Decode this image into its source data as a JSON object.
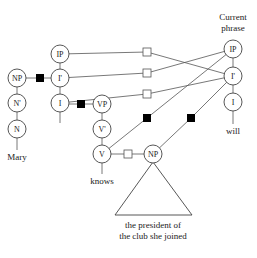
{
  "diagram": {
    "header": {
      "line1": "Current",
      "line2": "phrase"
    },
    "colors": {
      "line": "#555555",
      "node_border": "#444444",
      "filled_square": "#000000",
      "open_square": "#ffffff",
      "text": "#1a1a1a"
    },
    "left_tree": {
      "nodes": [
        {
          "id": "np_subject",
          "label": "NP",
          "x": 17,
          "y": 78
        },
        {
          "id": "n_bar",
          "label": "N'",
          "x": 17,
          "y": 103
        },
        {
          "id": "n",
          "label": "N",
          "x": 17,
          "y": 129
        },
        {
          "id": "ip",
          "label": "IP",
          "x": 60,
          "y": 54
        },
        {
          "id": "i_bar",
          "label": "I'",
          "x": 60,
          "y": 78
        },
        {
          "id": "i",
          "label": "I",
          "x": 60,
          "y": 103
        },
        {
          "id": "vp",
          "label": "VP",
          "x": 102,
          "y": 104
        },
        {
          "id": "v_bar",
          "label": "V'",
          "x": 102,
          "y": 129
        },
        {
          "id": "v",
          "label": "V",
          "x": 102,
          "y": 154
        },
        {
          "id": "np_object",
          "label": "NP",
          "x": 153,
          "y": 154
        }
      ],
      "words": [
        {
          "id": "mary",
          "text": "Mary",
          "x": 17,
          "y": 159
        },
        {
          "id": "knows",
          "text": "knows",
          "x": 102,
          "y": 183
        }
      ],
      "np_object_text": {
        "line1": "the president of",
        "line2": "the club she joined"
      }
    },
    "current_phrase": {
      "nodes": [
        {
          "id": "cp_ip",
          "label": "IP",
          "x": 233,
          "y": 49
        },
        {
          "id": "cp_i_bar",
          "label": "I'",
          "x": 233,
          "y": 76
        },
        {
          "id": "cp_i",
          "label": "I",
          "x": 233,
          "y": 102
        }
      ],
      "word": {
        "text": "will",
        "x": 233,
        "y": 133
      }
    },
    "links": [
      {
        "from": "ip",
        "to": "cp_i_bar",
        "marker": "open",
        "mx": 147,
        "my": 52
      },
      {
        "from": "i_bar",
        "to": "cp_ip",
        "marker": "open",
        "mx": 147,
        "my": 73
      },
      {
        "from": "i",
        "to": "cp_i_bar",
        "marker": "open",
        "mx": 147,
        "my": 94
      },
      {
        "from": "v",
        "to": "cp_ip",
        "marker": "filled",
        "mx": 147,
        "my": 118
      },
      {
        "from": "np_object",
        "to": "cp_i_bar",
        "marker": "filled",
        "mx": 191,
        "my": 118
      }
    ],
    "local_markers": [
      {
        "between": "np_subject-i_bar",
        "marker": "filled",
        "mx": 40,
        "my": 78
      },
      {
        "between": "i-vp",
        "marker": "filled",
        "mx": 81,
        "my": 104
      },
      {
        "between": "v-np_object",
        "marker": "open",
        "mx": 128,
        "my": 154
      }
    ]
  }
}
